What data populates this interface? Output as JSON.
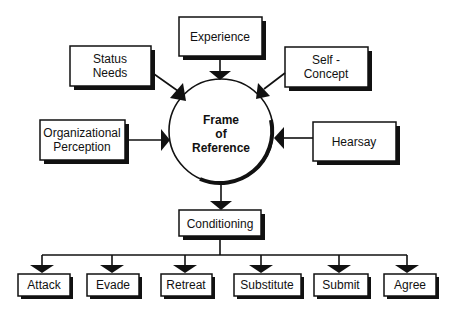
{
  "diagram": {
    "center": {
      "line1": "Frame",
      "line2": "of",
      "line3": "Reference"
    },
    "inputs": {
      "experience": {
        "label": "Experience"
      },
      "status_needs": {
        "line1": "Status",
        "line2": "Needs"
      },
      "self_concept": {
        "line1": "Self -",
        "line2": "Concept"
      },
      "organizational_perception": {
        "line1": "Organizational",
        "line2": "Perception"
      },
      "hearsay": {
        "label": "Hearsay"
      }
    },
    "output": {
      "label": "Conditioning"
    },
    "responses": [
      {
        "label": "Attack"
      },
      {
        "label": "Evade"
      },
      {
        "label": "Retreat"
      },
      {
        "label": "Substitute"
      },
      {
        "label": "Submit"
      },
      {
        "label": "Agree"
      }
    ],
    "colors": {
      "ink": "#111111",
      "background": "#ffffff"
    }
  }
}
